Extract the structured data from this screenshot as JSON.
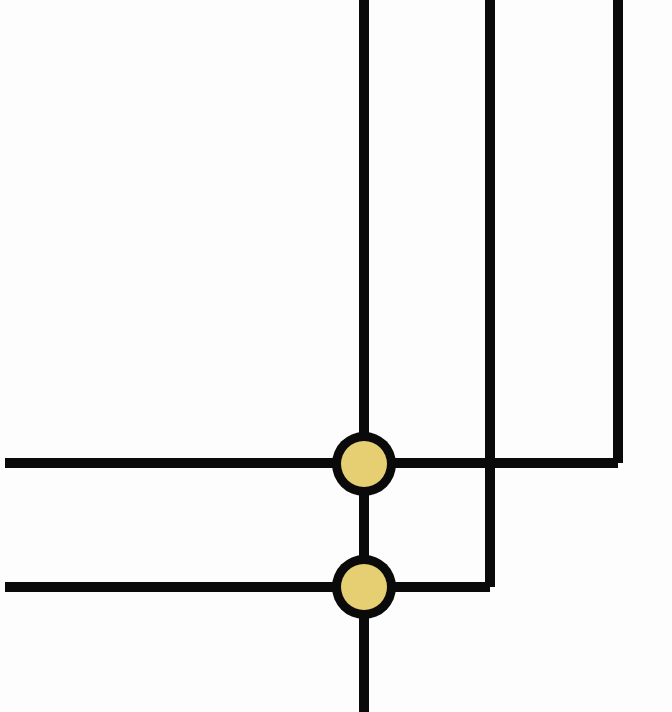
{
  "diagram": {
    "type": "wiring-junction-diagram",
    "width": 672,
    "height": 712,
    "background": "#fdfdfd",
    "wire_color": "#0a0a0a",
    "wire_width": 10,
    "junction": {
      "outer_radius": 32,
      "ring_color": "#0a0a0a",
      "inner_radius": 23,
      "fill_color": "#E6CF73"
    },
    "wires": [
      {
        "id": "vertical-main",
        "points": [
          [
            364,
            0
          ],
          [
            364,
            712
          ]
        ]
      },
      {
        "id": "vertical-middle",
        "points": [
          [
            490,
            0
          ],
          [
            490,
            587
          ]
        ]
      },
      {
        "id": "vertical-right",
        "points": [
          [
            618,
            0
          ],
          [
            618,
            463
          ]
        ]
      },
      {
        "id": "horizontal-upper",
        "points": [
          [
            5,
            463
          ],
          [
            618,
            463
          ]
        ]
      },
      {
        "id": "horizontal-lower",
        "points": [
          [
            5,
            587
          ],
          [
            490,
            587
          ]
        ]
      }
    ],
    "junctions": [
      {
        "id": "junction-upper",
        "cx": 364,
        "cy": 464
      },
      {
        "id": "junction-lower",
        "cx": 364,
        "cy": 587
      }
    ],
    "crossings": [
      {
        "id": "crossing-no-connection",
        "x": 490,
        "y": 463
      }
    ]
  }
}
